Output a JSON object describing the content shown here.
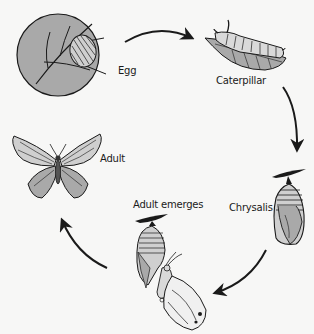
{
  "stages": [
    {
      "id": "egg",
      "label": "Egg"
    },
    {
      "id": "caterpillar",
      "label": "Caterpillar"
    },
    {
      "id": "chrysalis",
      "label": "Chrysalis"
    },
    {
      "id": "adult-emerges",
      "label": "Adult emerges"
    },
    {
      "id": "adult",
      "label": "Adult"
    }
  ],
  "arrows": [
    {
      "from": "egg",
      "to": "caterpillar"
    },
    {
      "from": "caterpillar",
      "to": "chrysalis"
    },
    {
      "from": "chrysalis",
      "to": "adult-emerges"
    },
    {
      "from": "adult-emerges",
      "to": "adult"
    }
  ],
  "colors": {
    "background": "#f7f7f6",
    "fill_gray": "#a9a9a9",
    "light_gray": "#cfcfcf",
    "stroke": "#1a1a1a"
  }
}
